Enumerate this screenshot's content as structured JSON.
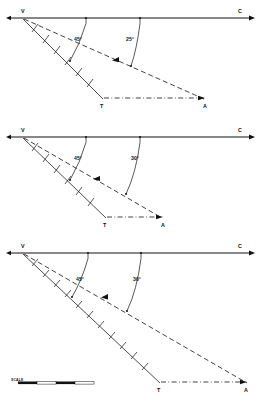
{
  "figure": {
    "scale_label": "SCALE",
    "background": "#ffffff",
    "ink": "#111111"
  },
  "panels": [
    {
      "id": "panel-1",
      "baseline": {
        "origin_label": "V",
        "end_label": "C",
        "y": 18,
        "x_start": 10,
        "x_end": 252
      },
      "angles": [
        {
          "value": "45°",
          "x": 86,
          "y": 37,
          "tick_x": 86
        },
        {
          "value": "25°",
          "x": 126,
          "y": 37,
          "tick_x": 140
        }
      ],
      "points": [
        {
          "label": "V",
          "x": 23,
          "y": 18
        },
        {
          "label": "C",
          "x": 240,
          "y": 11
        },
        {
          "label": "T",
          "x": 102,
          "y": 103
        },
        {
          "label": "A",
          "x": 205,
          "y": 103
        }
      ],
      "solid_line": {
        "from": [
          23,
          19
        ],
        "to": [
          102,
          98
        ],
        "ticks": 7
      },
      "dashed_line": {
        "from": [
          23,
          19
        ],
        "to": [
          205,
          98
        ]
      },
      "dashdot_line": {
        "from": [
          102,
          98
        ],
        "to": [
          203,
          98
        ],
        "ticks": 4
      },
      "arcs": [
        {
          "from": [
            86,
            22
          ],
          "to": [
            70,
            60
          ]
        },
        {
          "from": [
            140,
            22
          ],
          "to": [
            131,
            65
          ]
        }
      ]
    },
    {
      "id": "panel-2",
      "baseline": {
        "origin_label": "V",
        "end_label": "C",
        "y": 137,
        "x_start": 10,
        "x_end": 252
      },
      "angles": [
        {
          "value": "45°",
          "x": 84,
          "y": 156,
          "tick_x": 86
        },
        {
          "value": "30°",
          "x": 135,
          "y": 156,
          "tick_x": 140
        }
      ],
      "points": [
        {
          "label": "V",
          "x": 23,
          "y": 137
        },
        {
          "label": "C",
          "x": 240,
          "y": 130
        },
        {
          "label": "T",
          "x": 105,
          "y": 222
        },
        {
          "label": "A",
          "x": 163,
          "y": 222
        }
      ],
      "solid_line": {
        "from": [
          23,
          138
        ],
        "to": [
          105,
          217
        ],
        "ticks": 7
      },
      "dashed_line": {
        "from": [
          23,
          138
        ],
        "to": [
          163,
          217
        ]
      },
      "dashdot_line": {
        "from": [
          105,
          217
        ],
        "to": [
          161,
          217
        ],
        "ticks": 3
      },
      "arcs": [
        {
          "from": [
            86,
            141
          ],
          "to": [
            70,
            179
          ]
        },
        {
          "from": [
            140,
            141
          ],
          "to": [
            126,
            193
          ]
        }
      ]
    },
    {
      "id": "panel-3",
      "baseline": {
        "origin_label": "V",
        "end_label": "C",
        "y": 253,
        "x_start": 10,
        "x_end": 252
      },
      "angles": [
        {
          "value": "45°",
          "x": 84,
          "y": 277,
          "tick_x": 88
        },
        {
          "value": "30°",
          "x": 137,
          "y": 277,
          "tick_x": 141
        }
      ],
      "points": [
        {
          "label": "V",
          "x": 23,
          "y": 253
        },
        {
          "label": "C",
          "x": 240,
          "y": 246
        },
        {
          "label": "T",
          "x": 159,
          "y": 388
        },
        {
          "label": "A",
          "x": 247,
          "y": 388
        }
      ],
      "solid_line": {
        "from": [
          23,
          254
        ],
        "to": [
          159,
          382
        ],
        "ticks": 12
      },
      "dashed_line": {
        "from": [
          23,
          254
        ],
        "to": [
          248,
          382
        ]
      },
      "dashdot_line": {
        "from": [
          159,
          382
        ],
        "to": [
          245,
          382
        ],
        "ticks": 6
      },
      "arcs": [
        {
          "from": [
            88,
            257
          ],
          "to": [
            72,
            296
          ]
        },
        {
          "from": [
            141,
            257
          ],
          "to": [
            127,
            310
          ]
        }
      ]
    }
  ],
  "scale": {
    "label": "SCALE",
    "x": 12,
    "y": 383,
    "segments": [
      {
        "x": 18,
        "width": 19,
        "filled": true
      },
      {
        "x": 37,
        "width": 19,
        "filled": false
      },
      {
        "x": 56,
        "width": 19,
        "filled": true
      },
      {
        "x": 75,
        "width": 19,
        "filled": false
      }
    ]
  }
}
